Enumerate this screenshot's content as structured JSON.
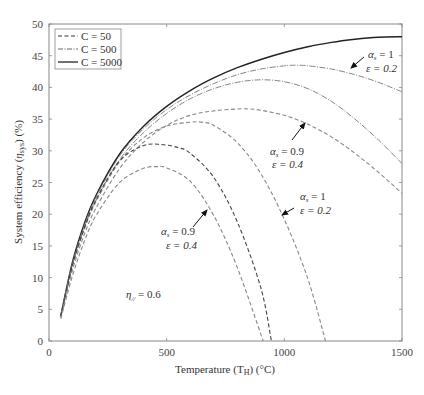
{
  "chart_data": {
    "type": "line",
    "title": "",
    "xlabel": "Temperature (T_H) (°C)",
    "ylabel": "System efficiency (η_sys) (%)",
    "xlim": [
      0,
      1500
    ],
    "ylim": [
      0,
      50
    ],
    "x_ticks": [
      0,
      500,
      1000,
      1500
    ],
    "y_ticks": [
      0,
      5,
      10,
      15,
      20,
      25,
      30,
      35,
      40,
      45,
      50
    ],
    "grid": false,
    "legend_position": "upper-left",
    "legend": [
      {
        "label": "C = 50",
        "style": "dashed"
      },
      {
        "label": "C = 500",
        "style": "dashdot"
      },
      {
        "label": "C = 5000",
        "style": "solid"
      }
    ],
    "series": [
      {
        "name": "C = 5000",
        "style": "solid",
        "color": "#222222",
        "x": [
          50,
          100,
          150,
          200,
          300,
          400,
          500,
          600,
          700,
          800,
          900,
          1000,
          1100,
          1200,
          1300,
          1400,
          1500
        ],
        "y": [
          4,
          12.5,
          18.5,
          23,
          29.5,
          33.8,
          37,
          39.5,
          41.5,
          43.1,
          44.4,
          45.5,
          46.4,
          47.1,
          47.6,
          47.9,
          48
        ]
      },
      {
        "name": "C = 500, αs = 1, ε = 0.2",
        "style": "dashdot",
        "color": "#777777",
        "x": [
          50,
          100,
          150,
          200,
          300,
          400,
          500,
          600,
          700,
          800,
          900,
          1000,
          1050,
          1100,
          1200,
          1300,
          1400,
          1500
        ],
        "y": [
          4,
          12.3,
          18.2,
          22.7,
          29.2,
          33.4,
          36.5,
          38.8,
          40.6,
          42,
          42.9,
          43.4,
          43.5,
          43.4,
          42.9,
          42,
          40.8,
          39.3
        ]
      },
      {
        "name": "C = 500, αs = 0.9, ε = 0.4",
        "style": "dashdot",
        "color": "#777777",
        "x": [
          50,
          100,
          150,
          200,
          300,
          400,
          500,
          600,
          700,
          800,
          900,
          1000,
          1100,
          1200,
          1300,
          1400,
          1500
        ],
        "y": [
          3.9,
          12,
          17.8,
          22.2,
          28.6,
          32.8,
          35.9,
          38.2,
          39.8,
          40.8,
          41.2,
          40.9,
          39.8,
          37.8,
          35,
          31.7,
          28
        ]
      },
      {
        "name": "C = 50, αs = 1, ε = 0.2 (upper)",
        "style": "dashed",
        "color": "#888888",
        "x": [
          50,
          100,
          150,
          200,
          300,
          400,
          500,
          600,
          700,
          800,
          850,
          900,
          1000,
          1100,
          1200,
          1300,
          1400,
          1500
        ],
        "y": [
          3.7,
          11.2,
          16.8,
          21,
          27.2,
          31.3,
          34,
          35.6,
          36.3,
          36.6,
          36.6,
          36.4,
          35.6,
          34.2,
          32.2,
          29.6,
          26.6,
          23.3
        ]
      },
      {
        "name": "C = 50, αs = 1, ε = 0.2",
        "style": "dashed",
        "color": "#888888",
        "x": [
          50,
          100,
          150,
          200,
          300,
          400,
          500,
          600,
          650,
          700,
          800,
          900,
          1000,
          1100,
          1175
        ],
        "y": [
          3.8,
          11.8,
          17.6,
          22,
          28.3,
          32,
          33.9,
          34.5,
          34.5,
          34,
          31.3,
          26.4,
          19.2,
          9.8,
          0
        ]
      },
      {
        "name": "C = 50, αs = 0.9, ε = 0.4 (dark)",
        "style": "dashed",
        "color": "#444444",
        "x": [
          50,
          100,
          150,
          200,
          300,
          400,
          475,
          550,
          600,
          700,
          800,
          900,
          945
        ],
        "y": [
          3.9,
          12,
          17.8,
          22.3,
          28.4,
          30.8,
          31,
          30.5,
          29.6,
          25.8,
          18.8,
          8.4,
          0
        ]
      },
      {
        "name": "C = 50, αs = 0.9, ε = 0.4",
        "style": "dashed",
        "color": "#888888",
        "x": [
          50,
          100,
          150,
          200,
          300,
          400,
          460,
          500,
          600,
          700,
          800,
          910
        ],
        "y": [
          3.5,
          10.3,
          15.7,
          19.8,
          25,
          27.2,
          27.5,
          27.3,
          25.2,
          19.8,
          11.6,
          0
        ]
      }
    ],
    "annotations": [
      {
        "text_line1": "αs = 1",
        "text_line2": "ε = 0.2",
        "target": "C=500 upper curves",
        "arrow": true
      },
      {
        "text_line1": "αs = 0.9",
        "text_line2": "ε = 0.4",
        "target": "C=500/50 middle curves",
        "arrow": true
      },
      {
        "text_line1": "αs = 1",
        "text_line2": "ε = 0.2",
        "target": "C=50 right curve",
        "arrow": true
      },
      {
        "text_line1": "αs = 0.9",
        "text_line2": "ε = 0.4",
        "target": "C=50 left curves",
        "arrow": true
      },
      {
        "text": "η// = 0.6",
        "arrow": false
      }
    ]
  },
  "labels": {
    "xlabel_prefix": "Temperature (T",
    "xlabel_sub": "H",
    "xlabel_suffix": ") (°C)",
    "ylabel_prefix": "System efficiency (",
    "ylabel_eta": "η",
    "ylabel_sub": "sys",
    "ylabel_suffix": ") (%)",
    "legend": [
      "C = 50",
      "C = 500",
      "C = 5000"
    ],
    "annot": {
      "a1_alpha": "α",
      "a1_sub": "s",
      "a1_val": " = 1",
      "a1_eps": "ε = 0.2",
      "a2_alpha": "α",
      "a2_sub": "s",
      "a2_val": " = 0.9",
      "a2_eps": "ε = 0.4",
      "a3_alpha": "α",
      "a3_sub": "s",
      "a3_val": " = 1",
      "a3_eps": "ε = 0.2",
      "a4_alpha": "α",
      "a4_sub": "s",
      "a4_val": " = 0.9",
      "a4_eps": "ε = 0.4",
      "eta_sym": "η",
      "eta_sub": "//",
      "eta_val": " = 0.6"
    }
  }
}
